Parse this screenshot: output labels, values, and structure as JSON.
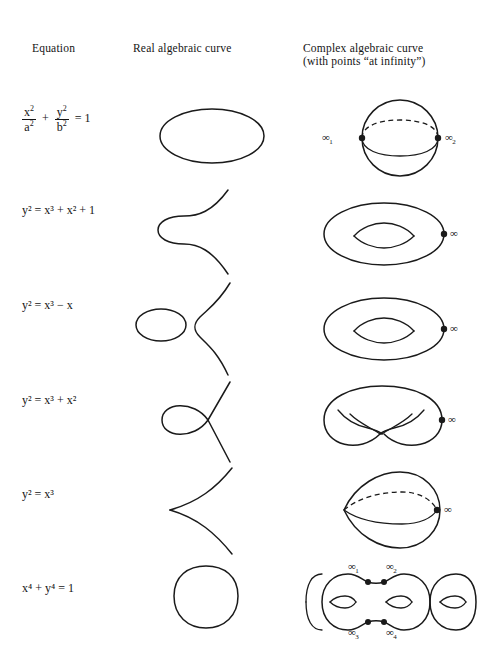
{
  "headers": {
    "equation": "Equation",
    "real": "Real algebraic curve",
    "complex_line1": "Complex algebraic curve",
    "complex_line2": "(with points “at infinity”)"
  },
  "symbols": {
    "infinity": "∞",
    "plus": "+",
    "minus": "−",
    "equals": "="
  },
  "rows": [
    {
      "equation_text": "x²/a² + y²/b² = 1",
      "equation_parts": {
        "num1": "x",
        "num1_sup": "2",
        "den1": "a",
        "den1_sup": "2",
        "op1": "+",
        "num2": "y",
        "num2_sup": "2",
        "den2": "b",
        "den2_sup": "2",
        "eq": "=",
        "rhs": "1"
      },
      "real_curve_name": "ellipse",
      "complex_curve_name": "sphere",
      "infinity_labels": [
        {
          "symbol": "∞",
          "subscript": "1"
        },
        {
          "symbol": "∞",
          "subscript": "2"
        }
      ]
    },
    {
      "equation_text": "y² = x³ + x² + 1",
      "real_curve_name": "smooth-cubic-one-branch",
      "complex_curve_name": "torus",
      "infinity_labels": [
        {
          "symbol": "∞",
          "subscript": ""
        }
      ]
    },
    {
      "equation_text": "y² = x³ − x",
      "real_curve_name": "smooth-cubic-oval-and-branch",
      "complex_curve_name": "torus",
      "infinity_labels": [
        {
          "symbol": "∞",
          "subscript": ""
        }
      ]
    },
    {
      "equation_text": "y² = x³ + x²",
      "real_curve_name": "nodal-cubic",
      "complex_curve_name": "pinched-torus",
      "infinity_labels": [
        {
          "symbol": "∞",
          "subscript": ""
        }
      ]
    },
    {
      "equation_text": "y² = x³",
      "real_curve_name": "cuspidal-cubic",
      "complex_curve_name": "cuspidal-sphere",
      "infinity_labels": [
        {
          "symbol": "∞",
          "subscript": ""
        }
      ]
    },
    {
      "equation_text": "x⁴ + y⁴ = 1",
      "real_curve_name": "squircle",
      "complex_curve_name": "genus-three-surface",
      "infinity_labels": [
        {
          "symbol": "∞",
          "subscript": "1"
        },
        {
          "symbol": "∞",
          "subscript": "2"
        },
        {
          "symbol": "∞",
          "subscript": "3"
        },
        {
          "symbol": "∞",
          "subscript": "4"
        }
      ]
    }
  ],
  "colors": {
    "ink": "#1a1a1a",
    "background": "#ffffff"
  }
}
